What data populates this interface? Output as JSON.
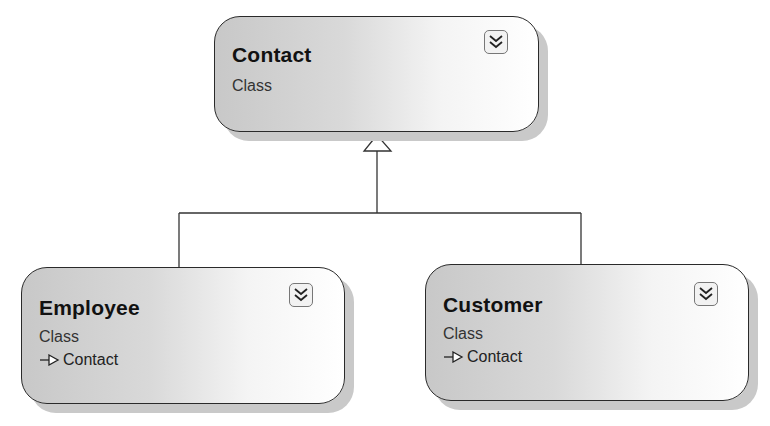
{
  "diagram": {
    "type": "class-diagram",
    "relationship": "inheritance",
    "colors": {
      "border": "#2a2a2a",
      "shadow": "#c9c9c9",
      "gradient_start": "#c8c8c8",
      "gradient_end": "#ffffff",
      "connector": "#333333"
    },
    "shapes": {
      "contact": {
        "name": "Contact",
        "kind": "Class",
        "expander_icon": "double-chevron-down-icon"
      },
      "employee": {
        "name": "Employee",
        "kind": "Class",
        "base_class": "Contact",
        "inheritance_icon": "inheritance-arrow-icon",
        "expander_icon": "double-chevron-down-icon"
      },
      "customer": {
        "name": "Customer",
        "kind": "Class",
        "base_class": "Contact",
        "inheritance_icon": "inheritance-arrow-icon",
        "expander_icon": "double-chevron-down-icon"
      }
    },
    "edges": [
      {
        "from": "Employee",
        "to": "Contact",
        "type": "generalization"
      },
      {
        "from": "Customer",
        "to": "Contact",
        "type": "generalization"
      }
    ]
  }
}
